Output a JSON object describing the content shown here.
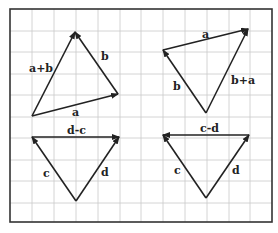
{
  "frame": {
    "x": 10,
    "y": 9,
    "width": 262,
    "height": 213
  },
  "grid": {
    "vertical": [
      32,
      54,
      76,
      98,
      120,
      141,
      163,
      185,
      207,
      229,
      250
    ],
    "horizontal": [
      31,
      52,
      74,
      95,
      117,
      138,
      160,
      181,
      203
    ]
  },
  "colors": {
    "grid": "#c9c9c9",
    "frame": "#333333",
    "vector": "#222222"
  },
  "diagrams": [
    {
      "id": "top-left",
      "vectors": [
        {
          "name": "a",
          "from": [
            32,
            116
          ],
          "to": [
            118,
            94
          ],
          "label": "a",
          "label_pos": [
            72,
            116
          ]
        },
        {
          "name": "b",
          "from": [
            118,
            94
          ],
          "to": [
            75,
            32
          ],
          "label": "b",
          "label_pos": [
            101,
            60
          ]
        },
        {
          "name": "a+b",
          "from": [
            32,
            116
          ],
          "to": [
            75,
            32
          ],
          "label": "a+b",
          "label_pos": [
            29,
            72
          ]
        }
      ]
    },
    {
      "id": "top-right",
      "vectors": [
        {
          "name": "a",
          "from": [
            163,
            50
          ],
          "to": [
            248,
            29
          ],
          "label": "a",
          "label_pos": [
            202,
            38
          ]
        },
        {
          "name": "b",
          "from": [
            206,
            113
          ],
          "to": [
            163,
            50
          ],
          "label": "b",
          "label_pos": [
            173,
            90
          ]
        },
        {
          "name": "b+a",
          "from": [
            206,
            113
          ],
          "to": [
            248,
            29
          ],
          "label": "b+a",
          "label_pos": [
            231,
            84
          ]
        }
      ]
    },
    {
      "id": "bottom-left",
      "vectors": [
        {
          "name": "d-c",
          "from": [
            32,
            137
          ],
          "to": [
            119,
            137
          ],
          "label": "d-c",
          "label_pos": [
            67,
            134
          ]
        },
        {
          "name": "c",
          "from": [
            76,
            201
          ],
          "to": [
            32,
            137
          ],
          "label": "c",
          "label_pos": [
            43,
            177
          ]
        },
        {
          "name": "d",
          "from": [
            76,
            201
          ],
          "to": [
            119,
            137
          ],
          "label": "d",
          "label_pos": [
            101,
            176
          ]
        }
      ]
    },
    {
      "id": "bottom-right",
      "vectors": [
        {
          "name": "c-d",
          "from": [
            249,
            135
          ],
          "to": [
            163,
            135
          ],
          "label": "c-d",
          "label_pos": [
            200,
            132
          ]
        },
        {
          "name": "c",
          "from": [
            206,
            198
          ],
          "to": [
            163,
            135
          ],
          "label": "c",
          "label_pos": [
            174,
            174
          ]
        },
        {
          "name": "d",
          "from": [
            206,
            198
          ],
          "to": [
            249,
            135
          ],
          "label": "d",
          "label_pos": [
            232,
            174
          ]
        }
      ]
    }
  ]
}
